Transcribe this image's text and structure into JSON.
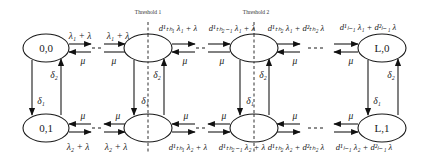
{
  "diagram": {
    "type": "state-transition (birth-death Markov chain)",
    "thresholds": [
      {
        "label": "Threshold 1",
        "position": "tier 1 column"
      },
      {
        "label": "Threshold 2",
        "position": "tier 2 column"
      }
    ],
    "nodes": {
      "top": [
        {
          "id": "n00",
          "label": "0,0"
        },
        {
          "id": "n10",
          "label": ""
        },
        {
          "id": "n20",
          "label": ""
        },
        {
          "id": "nL0",
          "label": "L,0"
        }
      ],
      "bottom": [
        {
          "id": "n01",
          "label": "0,1"
        },
        {
          "id": "n11",
          "label": ""
        },
        {
          "id": "n21",
          "label": ""
        },
        {
          "id": "nL1",
          "label": "L,1"
        }
      ]
    },
    "top_rates": {
      "r1": "λ₁ + λ",
      "r2": "λ₁ + λ",
      "r3": "d¹ₜₕ₁ λ₁ + λ",
      "r4": "d¹ₜₕ₂₋₁ λ₁ + λ",
      "r5": "d¹ₜₕ₂ λ₁ + d²ₜₕ₂ λ",
      "r6": "d¹ₗ₋₁ λ₁ + d²ₗ₋₁ λ"
    },
    "bottom_rates": {
      "r1": "λ₂ + λ",
      "r2": "λ₂ + λ",
      "r3": "d¹ₜₕ₁ λ₂ + λ",
      "r4": "d¹ₜₕ₂₋₁ λ₂ + λ",
      "r5": "d¹ₜₕ₂ λ₂ + d²ₜₕ₂ λ",
      "r6": "d¹ₗ₋₁ λ₂ + d²ₗ₋₁ λ"
    },
    "service_rate": "μ",
    "switch_down": "δ₁",
    "switch_up": "δ₂",
    "ellipsis": "- - -"
  }
}
